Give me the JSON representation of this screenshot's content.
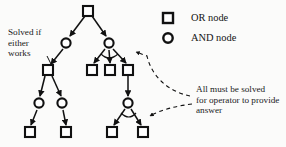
{
  "figure": {
    "type": "and-or-tree-diagram",
    "background_color": "#fbfbfa",
    "ink_color": "#111111"
  },
  "legend": {
    "or_node": {
      "label": "OR node",
      "shape": "square",
      "x": 168,
      "y": 18
    },
    "and_node": {
      "label": "AND node",
      "shape": "circle",
      "x": 168,
      "y": 38
    }
  },
  "annotations": {
    "left": {
      "lines": [
        "Solved if",
        "either",
        "works"
      ],
      "text": "Solved if\neither\nworks"
    },
    "right": {
      "lines": [
        "All must be solved",
        "for operator to provide",
        "answer"
      ],
      "text": "All must be solved\nfor operator to provide\nanswer"
    }
  },
  "nodes": [
    {
      "id": "n1",
      "type": "OR",
      "shape": "square",
      "x": 88,
      "y": 11
    },
    {
      "id": "n2",
      "type": "AND",
      "shape": "circle",
      "x": 66,
      "y": 43
    },
    {
      "id": "n3",
      "type": "AND",
      "shape": "circle",
      "x": 109,
      "y": 43
    },
    {
      "id": "n4",
      "type": "OR",
      "shape": "square",
      "x": 48,
      "y": 70
    },
    {
      "id": "n5",
      "type": "OR",
      "shape": "square",
      "x": 92,
      "y": 70
    },
    {
      "id": "n6",
      "type": "OR",
      "shape": "square",
      "x": 110,
      "y": 70
    },
    {
      "id": "n7",
      "type": "OR",
      "shape": "square",
      "x": 128,
      "y": 70
    },
    {
      "id": "n8",
      "type": "AND",
      "shape": "circle",
      "x": 39,
      "y": 103
    },
    {
      "id": "n9",
      "type": "AND",
      "shape": "circle",
      "x": 62,
      "y": 103
    },
    {
      "id": "n10",
      "type": "AND",
      "shape": "circle",
      "x": 128,
      "y": 103
    },
    {
      "id": "n11",
      "type": "OR",
      "shape": "square",
      "x": 30,
      "y": 132
    },
    {
      "id": "n12",
      "type": "OR",
      "shape": "square",
      "x": 66,
      "y": 132
    },
    {
      "id": "n13",
      "type": "OR",
      "shape": "square",
      "x": 112,
      "y": 132
    },
    {
      "id": "n14",
      "type": "OR",
      "shape": "square",
      "x": 143,
      "y": 132
    }
  ],
  "edges": [
    {
      "from": "n1",
      "to": "n2"
    },
    {
      "from": "n1",
      "to": "n3"
    },
    {
      "from": "n2",
      "to": "n4"
    },
    {
      "from": "n3",
      "to": "n5"
    },
    {
      "from": "n3",
      "to": "n6"
    },
    {
      "from": "n3",
      "to": "n7"
    },
    {
      "from": "n4",
      "to": "n8"
    },
    {
      "from": "n4",
      "to": "n9"
    },
    {
      "from": "n7",
      "to": "n10"
    },
    {
      "from": "n8",
      "to": "n11"
    },
    {
      "from": "n9",
      "to": "n12"
    },
    {
      "from": "n10",
      "to": "n13"
    },
    {
      "from": "n10",
      "to": "n14"
    }
  ],
  "and_arcs": [
    {
      "at": "n3",
      "label": "and-arc-upper"
    },
    {
      "at": "n10",
      "label": "and-arc-lower"
    }
  ],
  "callouts": [
    {
      "id": "left-pointer",
      "style": "solid",
      "from": "annotation-left",
      "to": "n2"
    },
    {
      "id": "right-pointer-upper",
      "style": "dashed",
      "from": "annotation-right",
      "to": "n3"
    },
    {
      "id": "right-pointer-lower",
      "style": "dashed",
      "from": "annotation-right",
      "to": "n10"
    }
  ]
}
